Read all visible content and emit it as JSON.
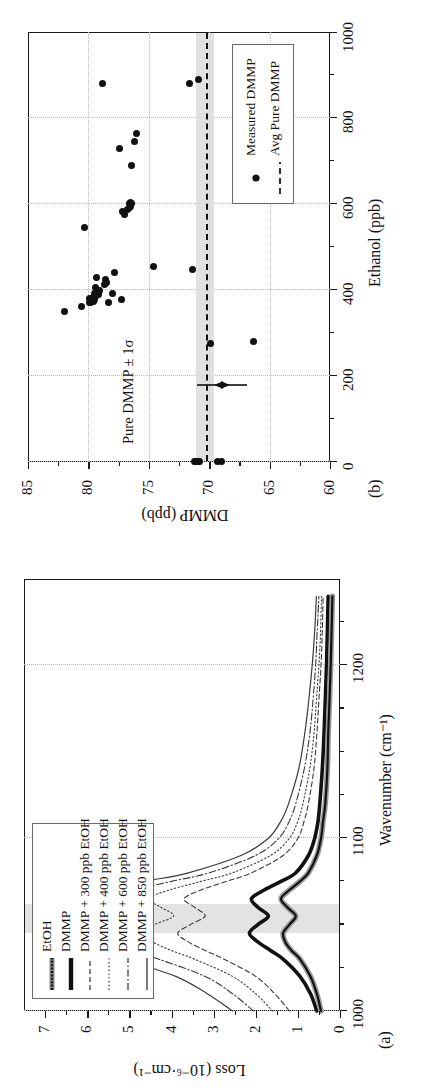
{
  "figure": {
    "kind": "two-panel scientific figure",
    "orientation": "rotated 90 degrees counter-clockwise on the page"
  },
  "panel_a": {
    "label": "(a)",
    "xlabel": "Wavenumber (cm⁻¹)",
    "ylabel": "Loss (10⁻⁶·cm⁻¹)",
    "xticks": [
      "1000",
      "1100",
      "1200"
    ],
    "yticks": [
      "0",
      "1",
      "2",
      "3",
      "4",
      "5",
      "6",
      "7"
    ],
    "legend": [
      {
        "label": "EtOH",
        "style": "thick-noisy"
      },
      {
        "label": "DMMP",
        "style": "thick-solid"
      },
      {
        "label": "DMMP + 300 ppb EtOH",
        "style": "dashed"
      },
      {
        "label": "DMMP + 400 ppb EtOH",
        "style": "dotted"
      },
      {
        "label": "DMMP + 600 ppb EtOH",
        "style": "dash-dot"
      },
      {
        "label": "DMMP + 850 ppb EtOH",
        "style": "solid"
      }
    ],
    "highlight_band_label": "shaded wavenumber band near 1050 cm⁻¹"
  },
  "panel_b": {
    "label": "(b)",
    "xlabel": "Ethanol (ppb)",
    "ylabel": "DMMP (ppb)",
    "xticks": [
      "0",
      "200",
      "400",
      "600",
      "800",
      "1000"
    ],
    "yticks": [
      "60",
      "65",
      "70",
      "75",
      "80",
      "85"
    ],
    "annotation": "Pure DMMP ± 1σ",
    "legend": [
      {
        "label": "Measured DMMP",
        "style": "marker-circle"
      },
      {
        "label": "Avg Pure DMMP",
        "style": "dashed-line"
      }
    ]
  },
  "chart_data": [
    {
      "type": "line",
      "title": "(a)",
      "xlabel": "Wavenumber (cm⁻¹)",
      "ylabel": "Loss (10⁻⁶·cm⁻¹)",
      "xlim": [
        1000,
        1250
      ],
      "ylim": [
        0,
        7.5
      ],
      "grid": true,
      "legend_position": "top-left",
      "shaded_band_x": [
        1045,
        1062
      ],
      "x": [
        1000,
        1010,
        1020,
        1030,
        1035,
        1040,
        1045,
        1050,
        1055,
        1060,
        1065,
        1070,
        1075,
        1080,
        1090,
        1100,
        1110,
        1120,
        1140,
        1160,
        1180,
        1200,
        1220,
        1240
      ],
      "series": [
        {
          "name": "EtOH",
          "style": "thick-noisy",
          "values": [
            0.45,
            0.55,
            0.7,
            0.95,
            1.15,
            1.3,
            1.35,
            1.2,
            1.05,
            1.25,
            1.4,
            1.2,
            0.95,
            0.75,
            0.55,
            0.45,
            0.4,
            0.35,
            0.3,
            0.28,
            0.25,
            0.22,
            0.2,
            0.18
          ]
        },
        {
          "name": "DMMP",
          "style": "thick-solid",
          "values": [
            0.55,
            0.7,
            0.95,
            1.35,
            1.65,
            1.95,
            2.15,
            1.95,
            1.7,
            1.95,
            2.1,
            1.8,
            1.4,
            1.05,
            0.75,
            0.6,
            0.52,
            0.48,
            0.42,
            0.38,
            0.35,
            0.32,
            0.3,
            0.28
          ]
        },
        {
          "name": "DMMP + 300 ppb EtOH",
          "style": "dashed",
          "values": [
            1.2,
            1.55,
            2.0,
            2.75,
            3.2,
            3.6,
            3.85,
            3.55,
            3.2,
            3.45,
            3.7,
            3.3,
            2.7,
            2.1,
            1.35,
            1.0,
            0.85,
            0.75,
            0.62,
            0.55,
            0.5,
            0.45,
            0.42,
            0.4
          ]
        },
        {
          "name": "DMMP + 400 ppb EtOH",
          "style": "dotted",
          "values": [
            1.6,
            2.0,
            2.55,
            3.45,
            4.0,
            4.45,
            4.75,
            4.4,
            3.95,
            4.25,
            4.55,
            4.05,
            3.3,
            2.55,
            1.65,
            1.2,
            1.0,
            0.88,
            0.72,
            0.62,
            0.56,
            0.5,
            0.46,
            0.44
          ]
        },
        {
          "name": "DMMP + 600 ppb EtOH",
          "style": "dash-dot",
          "values": [
            2.05,
            2.55,
            3.2,
            4.3,
            4.95,
            5.45,
            5.8,
            5.35,
            4.8,
            5.15,
            5.5,
            4.9,
            4.0,
            3.1,
            2.0,
            1.45,
            1.2,
            1.05,
            0.85,
            0.72,
            0.64,
            0.58,
            0.54,
            0.5
          ]
        },
        {
          "name": "DMMP + 850 ppb EtOH",
          "style": "solid",
          "values": [
            2.55,
            3.15,
            3.9,
            5.15,
            5.9,
            6.45,
            6.8,
            6.25,
            5.6,
            6.0,
            6.4,
            5.7,
            4.65,
            3.6,
            2.35,
            1.7,
            1.4,
            1.22,
            0.98,
            0.84,
            0.74,
            0.66,
            0.6,
            0.56
          ]
        }
      ]
    },
    {
      "type": "scatter",
      "title": "(b)",
      "xlabel": "Ethanol (ppb)",
      "ylabel": "DMMP (ppb)",
      "xlim": [
        0,
        1000
      ],
      "ylim": [
        60,
        85
      ],
      "grid": true,
      "legend_position": "bottom-right",
      "avg_pure_dmmp": 70.3,
      "sigma_band": [
        69.6,
        71.1
      ],
      "annotation": "Pure DMMP ± 1σ",
      "series": [
        {
          "name": "Measured DMMP",
          "points": [
            [
              0,
              71.1
            ],
            [
              0,
              71.0
            ],
            [
              0,
              70.9
            ],
            [
              0,
              71.2
            ],
            [
              0,
              70.8
            ],
            [
              0,
              69.3
            ],
            [
              0,
              69.0
            ],
            [
              275,
              69.9
            ],
            [
              280,
              66.3
            ],
            [
              350,
              82.0
            ],
            [
              362,
              80.6
            ],
            [
              370,
              79.9
            ],
            [
              372,
              79.8
            ],
            [
              374,
              79.6
            ],
            [
              376,
              79.7
            ],
            [
              378,
              79.5
            ],
            [
              380,
              79.9
            ],
            [
              383,
              79.6
            ],
            [
              386,
              79.4
            ],
            [
              389,
              79.2
            ],
            [
              392,
              79.5
            ],
            [
              370,
              78.3
            ],
            [
              378,
              77.3
            ],
            [
              392,
              78.0
            ],
            [
              398,
              79.1
            ],
            [
              405,
              79.4
            ],
            [
              412,
              78.7
            ],
            [
              418,
              78.5
            ],
            [
              424,
              78.6
            ],
            [
              430,
              79.3
            ],
            [
              440,
              77.8
            ],
            [
              448,
              71.4
            ],
            [
              455,
              74.6
            ],
            [
              545,
              80.3
            ],
            [
              575,
              77.0
            ],
            [
              582,
              77.2
            ],
            [
              588,
              76.8
            ],
            [
              592,
              76.6
            ],
            [
              595,
              76.5
            ],
            [
              600,
              76.4
            ],
            [
              600,
              76.6
            ],
            [
              604,
              76.5
            ],
            [
              690,
              76.4
            ],
            [
              730,
              77.4
            ],
            [
              745,
              76.2
            ],
            [
              765,
              76.0
            ],
            [
              880,
              78.8
            ],
            [
              880,
              71.6
            ],
            [
              890,
              70.9
            ]
          ]
        }
      ]
    }
  ]
}
